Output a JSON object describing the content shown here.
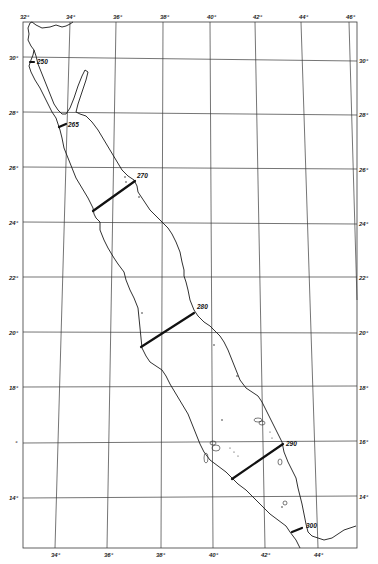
{
  "map": {
    "title": "",
    "region": "Red Sea",
    "top_longitude_labels": [
      {
        "label": "32°",
        "x": 20,
        "y": 20
      },
      {
        "label": "34°",
        "x": 66,
        "y": 20
      },
      {
        "label": "36°",
        "x": 113,
        "y": 20
      },
      {
        "label": "38°",
        "x": 160,
        "y": 20
      },
      {
        "label": "40°",
        "x": 207,
        "y": 20
      },
      {
        "label": "42°",
        "x": 253,
        "y": 20
      },
      {
        "label": "44°",
        "x": 299,
        "y": 20
      },
      {
        "label": "46°",
        "x": 346,
        "y": 20
      }
    ],
    "bottom_longitude_labels": [
      {
        "label": "34°",
        "x": 51,
        "y": 556
      },
      {
        "label": "36°",
        "x": 104,
        "y": 556
      },
      {
        "label": "38°",
        "x": 156,
        "y": 556
      },
      {
        "label": "40°",
        "x": 209,
        "y": 556
      },
      {
        "label": "42°",
        "x": 261,
        "y": 556
      },
      {
        "label": "44°",
        "x": 314,
        "y": 556
      }
    ],
    "left_latitude_labels": [
      {
        "label": "30°",
        "x": 8,
        "y": 60
      },
      {
        "label": "28°",
        "x": 8,
        "y": 115
      },
      {
        "label": "26°",
        "x": 8,
        "y": 170
      },
      {
        "label": "24°",
        "x": 8,
        "y": 225
      },
      {
        "label": "22°",
        "x": 8,
        "y": 280
      },
      {
        "label": "20°",
        "x": 8,
        "y": 335
      },
      {
        "label": "18°",
        "x": 8,
        "y": 390
      },
      {
        "label": "°",
        "x": 14,
        "y": 445
      },
      {
        "label": "14°",
        "x": 8,
        "y": 500
      }
    ],
    "right_latitude_labels": [
      {
        "label": "30°",
        "x": 360,
        "y": 63
      },
      {
        "label": "28°",
        "x": 360,
        "y": 117
      },
      {
        "label": "26°",
        "x": 360,
        "y": 172
      },
      {
        "label": "24°",
        "x": 360,
        "y": 226
      },
      {
        "label": "22°",
        "x": 360,
        "y": 280
      },
      {
        "label": "20°",
        "x": 360,
        "y": 335
      },
      {
        "label": "18°",
        "x": 360,
        "y": 390
      },
      {
        "label": "16°",
        "x": 360,
        "y": 444
      },
      {
        "label": "14°",
        "x": 360,
        "y": 499
      }
    ],
    "transects": [
      {
        "label": "250",
        "x1": 30,
        "y1": 62,
        "x2": 34,
        "y2": 62,
        "lx": 37,
        "ly": 64
      },
      {
        "label": "265",
        "x1": 59,
        "y1": 127,
        "x2": 66,
        "y2": 124,
        "lx": 68,
        "ly": 127
      },
      {
        "label": "270",
        "x1": 93,
        "y1": 211,
        "x2": 135,
        "y2": 181,
        "lx": 137,
        "ly": 178
      },
      {
        "label": "280",
        "x1": 141,
        "y1": 347,
        "x2": 194,
        "y2": 313,
        "lx": 197,
        "ly": 309
      },
      {
        "label": "290",
        "x1": 232,
        "y1": 479,
        "x2": 283,
        "y2": 444,
        "lx": 286,
        "ly": 446
      },
      {
        "label": "300",
        "x1": 292,
        "y1": 532,
        "x2": 302,
        "y2": 528,
        "lx": 306,
        "ly": 528
      }
    ]
  }
}
